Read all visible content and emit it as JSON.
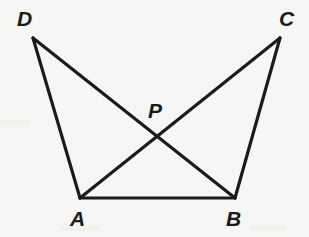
{
  "figure": {
    "background_color": "#f6f6f4",
    "stroke_color": "#1b1b1b",
    "label_color": "#1b1b1b",
    "width": 309,
    "height": 237,
    "points": {
      "D": {
        "label": "D",
        "x": 33,
        "y": 38,
        "label_x": 17,
        "label_y": 8
      },
      "C": {
        "label": "C",
        "x": 280,
        "y": 38,
        "label_x": 279,
        "label_y": 8
      },
      "A": {
        "label": "A",
        "x": 80,
        "y": 198,
        "label_x": 70,
        "label_y": 208
      },
      "B": {
        "label": "B",
        "x": 235,
        "y": 198,
        "label_x": 226,
        "label_y": 208
      },
      "P": {
        "label": "P",
        "x": 157,
        "y": 136,
        "label_x": 148,
        "label_y": 100
      }
    },
    "segments": [
      {
        "name": "segment-DA",
        "from": "D",
        "to": "A",
        "x1": 33,
        "y1": 38,
        "x2": 80,
        "y2": 198,
        "width": 3.2
      },
      {
        "name": "segment-DB",
        "from": "D",
        "to": "B",
        "x1": 33,
        "y1": 38,
        "x2": 235,
        "y2": 198,
        "width": 3.2
      },
      {
        "name": "segment-CB",
        "from": "C",
        "to": "B",
        "x1": 280,
        "y1": 38,
        "x2": 235,
        "y2": 198,
        "width": 3.2
      },
      {
        "name": "segment-CA",
        "from": "C",
        "to": "A",
        "x1": 280,
        "y1": 38,
        "x2": 80,
        "y2": 198,
        "width": 3.2
      },
      {
        "name": "segment-AB",
        "from": "A",
        "to": "B",
        "x1": 80,
        "y1": 198,
        "x2": 235,
        "y2": 198,
        "width": 3.2
      }
    ]
  }
}
